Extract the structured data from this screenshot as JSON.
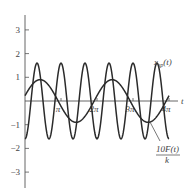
{
  "chart_data": {
    "type": "line",
    "title": "",
    "xlabel": "t",
    "ylabel": "",
    "xlim": [
      0,
      12.566
    ],
    "ylim": [
      -3.5,
      3.6
    ],
    "grid": false,
    "legend": "inline labels",
    "x_ticks": [
      {
        "value": 3.1416,
        "label": "π"
      },
      {
        "value": 6.2832,
        "label": "2π"
      },
      {
        "value": 9.4248,
        "label": "3π"
      },
      {
        "value": 12.566,
        "label": "4π"
      }
    ],
    "y_ticks": [
      {
        "value": 3,
        "label": "3"
      },
      {
        "value": 2,
        "label": "2"
      },
      {
        "value": 1,
        "label": "1"
      },
      {
        "value": -1,
        "label": "−1"
      },
      {
        "value": -2,
        "label": "−2"
      },
      {
        "value": -3,
        "label": "−3"
      }
    ],
    "series": [
      {
        "name": "x_sp(t)",
        "label_main": "x",
        "label_sub": "sp",
        "label_tail": "(t)",
        "description": "fast oscillation, approx -1.6 cos(3t)",
        "amplitude": 1.6,
        "omega": 3.0,
        "phase": 3.1416,
        "x": [
          0,
          0.5236,
          1.0472,
          1.5708,
          2.0944,
          2.618,
          3.1416,
          3.6652,
          4.1888,
          4.7124,
          5.236,
          5.7596,
          6.2832,
          6.8068,
          7.3304,
          7.854,
          8.3776,
          8.9012,
          9.4248,
          9.9484,
          10.472,
          10.9956,
          11.5192,
          12.0428,
          12.566
        ],
        "values": [
          -1.6,
          0,
          1.6,
          0,
          -1.6,
          0,
          1.6,
          0,
          -1.6,
          0,
          1.6,
          0,
          -1.6,
          0,
          1.6,
          0,
          -1.6,
          0,
          1.6,
          0,
          -1.6,
          0,
          1.6,
          0,
          -1.6
        ]
      },
      {
        "name": "10F(t)/k",
        "label_num": "10F(t)",
        "label_den": "k",
        "description": "slow sinusoid, approx 0.9 sin(t + 0.25)",
        "amplitude": 0.9,
        "omega": 1.0,
        "phase": 0.25,
        "x": [
          0,
          1.3208,
          2.8916,
          4.4624,
          6.0332,
          7.604,
          9.1748,
          10.7456,
          12.566
        ],
        "values": [
          0.22,
          0.9,
          0.0,
          -0.9,
          0.0,
          0.9,
          0.0,
          -0.9,
          0.22
        ]
      }
    ]
  }
}
